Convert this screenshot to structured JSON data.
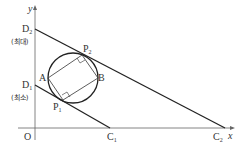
{
  "diagram": {
    "axes": {
      "x_label": "x",
      "y_label": "y",
      "origin_label": "O"
    },
    "points": {
      "D2": {
        "label": "D",
        "sub": "2",
        "note": "(최대)"
      },
      "D1": {
        "label": "D",
        "sub": "1",
        "note": "(최소)"
      },
      "C1": {
        "label": "C",
        "sub": "1"
      },
      "C2": {
        "label": "C",
        "sub": "2"
      },
      "P1": {
        "label": "P",
        "sub": "1"
      },
      "P2": {
        "label": "P",
        "sub": "2"
      },
      "A": {
        "label": "A"
      },
      "B": {
        "label": "B"
      }
    },
    "colors": {
      "line": "#222222",
      "axis": "#555555",
      "text": "#333333"
    }
  }
}
